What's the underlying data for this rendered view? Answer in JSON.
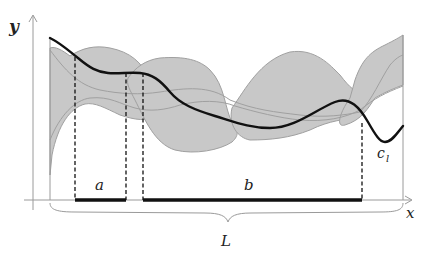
{
  "diagram": {
    "axes": {
      "y_label": "y",
      "x_label": "x"
    },
    "curve_label": {
      "base": "c",
      "subscript": "l"
    },
    "segments": [
      {
        "label": "a",
        "x_start": 75,
        "x_end": 126
      },
      {
        "label": "b",
        "x_start": 143,
        "x_end": 362
      }
    ],
    "brace_label": "L",
    "colors": {
      "band_fill": "#c8c8c8",
      "band_stroke": "#a0a0a0",
      "curve": "#111111",
      "axis": "#9a9a9a",
      "segment": "#111111"
    }
  }
}
